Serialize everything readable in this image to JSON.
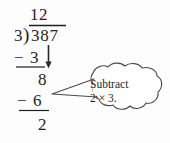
{
  "figure": {
    "background_color": "#fdfdfd",
    "ink_color": "#1f1f1f"
  },
  "division": {
    "quotient": "12",
    "divisor": "3",
    "bracket_glyph": ")",
    "dividend": "387",
    "steps": [
      {
        "sign": "−",
        "value": "3",
        "note": "subtract 1 × 3"
      },
      {
        "partial": "8"
      },
      {
        "sign": "−",
        "value": "6",
        "note": "subtract 2 × 3"
      },
      {
        "remainder": "2"
      }
    ],
    "subtrahend_1_sign": "−",
    "subtrahend_1_value": "3",
    "partial_remainder": "8",
    "subtrahend_2_sign": "−",
    "subtrahend_2_value": "6",
    "final_remainder": "2",
    "bring_down_arrow": "down-arrow"
  },
  "callout": {
    "line1": "Subtract",
    "line2": "2 × 3.",
    "shape": "cloud-bubble",
    "pointer_direction": "left",
    "stroke_color": "#444444"
  }
}
